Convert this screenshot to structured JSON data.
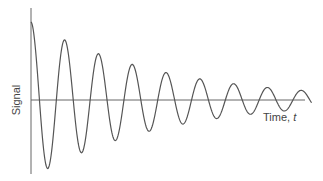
{
  "chart_data": {
    "type": "line",
    "title": "",
    "xlabel": "Time, t",
    "ylabel": "Signal",
    "grid": false,
    "legend": null,
    "series": [
      {
        "name": "Signal",
        "model": "A*exp(-k*t)*cos(2*pi*t/T)",
        "amplitude": 1.0,
        "decay_per_period": 0.77,
        "period": 1,
        "cycles": 8.3,
        "peaks": [
          {
            "t": 0,
            "value": 1.0
          },
          {
            "t": 1,
            "value": 0.73
          },
          {
            "t": 2,
            "value": 0.54
          },
          {
            "t": 3,
            "value": 0.4
          },
          {
            "t": 4,
            "value": 0.28
          },
          {
            "t": 5,
            "value": 0.23
          },
          {
            "t": 6,
            "value": 0.15
          },
          {
            "t": 7,
            "value": 0.11
          }
        ],
        "troughs": [
          {
            "t": 0.5,
            "value": -0.85
          },
          {
            "t": 1.5,
            "value": -0.63
          },
          {
            "t": 2.5,
            "value": -0.46
          },
          {
            "t": 3.5,
            "value": -0.33
          },
          {
            "t": 4.5,
            "value": -0.24
          },
          {
            "t": 5.5,
            "value": -0.17
          },
          {
            "t": 6.5,
            "value": -0.12
          },
          {
            "t": 7.5,
            "value": -0.08
          }
        ]
      }
    ],
    "colors": {
      "line": "#555555",
      "axis": "#555555"
    }
  },
  "labels": {
    "y_axis": "Signal",
    "x_axis_text": "Time, ",
    "x_axis_var": "t"
  }
}
